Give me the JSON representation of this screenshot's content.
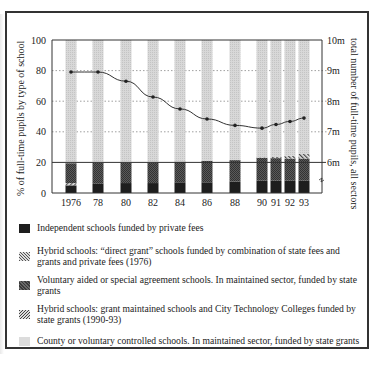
{
  "chart_data": {
    "type": "bar",
    "subtype": "stacked bar with line overlay (dual axis)",
    "title": "",
    "categories": [
      "1976",
      "78",
      "80",
      "82",
      "84",
      "86",
      "88",
      "90",
      "91",
      "92",
      "93"
    ],
    "ylabel": "% of full-time pupils by type of school",
    "ylim": [
      0,
      100
    ],
    "yticks": [
      "0",
      "20",
      "40",
      "60",
      "80",
      "100"
    ],
    "y2label": "total number of full-time pupils, all sectors",
    "y2lim": [
      "6m",
      "10m"
    ],
    "y2ticks": [
      "6m",
      "7m",
      "8m",
      "9m",
      "10m"
    ],
    "grid": "dotted horizontal at 40, 60, 80; solid line at 20",
    "legend_position": "below",
    "series": [
      {
        "name": "Independent schools funded by private fees",
        "key": "indep",
        "values": [
          5,
          6,
          6.5,
          6.5,
          7,
          7,
          7.5,
          8,
          8,
          8,
          8
        ]
      },
      {
        "name": "Hybrid schools: “direct grant” schools funded by combination of state fees and grants and private fees (1976)",
        "key": "direct",
        "values": [
          1.5,
          0,
          0,
          0,
          0,
          0,
          0,
          0,
          0,
          0,
          0
        ]
      },
      {
        "name": "Voluntary aided or special agreement schools. In maintained sector, funded by state grants",
        "key": "va",
        "values": [
          13,
          14,
          13.5,
          13.5,
          13.5,
          14,
          14,
          15,
          14.8,
          14.5,
          14.5
        ]
      },
      {
        "name": "Hybrid schools: grant maintained schools and City Technology Colleges funded by state grants (1990-93)",
        "key": "gm",
        "values": [
          0,
          0,
          0,
          0,
          0,
          0,
          0,
          0.3,
          0.8,
          1.8,
          3
        ]
      },
      {
        "name": "County or voluntary controlled schools. In maintained sector, funded by state grants",
        "key": "county",
        "values": [
          80.5,
          80,
          80,
          80,
          79.5,
          79,
          78.5,
          76.7,
          76.4,
          75.7,
          74.5
        ]
      }
    ],
    "line_series": {
      "name": "total number of full-time pupils, all sectors (millions)",
      "axis": "right",
      "values": [
        8.95,
        8.95,
        8.65,
        8.13,
        7.74,
        7.41,
        7.2,
        7.11,
        7.23,
        7.33,
        7.44
      ]
    }
  },
  "axes": {
    "left_ticks": [
      "100",
      "80",
      "60",
      "40",
      "20",
      "0"
    ],
    "right_ticks": [
      "10m",
      "9m",
      "8m",
      "7m",
      "6m"
    ],
    "left_title": "% of full-time pupils by type of school",
    "right_title": "total number of full-time pupils, all sectors",
    "x_labels": [
      "1976",
      "78",
      "80",
      "82",
      "84",
      "86",
      "88",
      "90",
      "91",
      "92",
      "93"
    ]
  },
  "legend": [
    {
      "swatch": "indep",
      "label": "Independent schools funded by private fees"
    },
    {
      "swatch": "direct",
      "label": "Hybrid schools: “direct grant” schools funded by combination of state fees and grants and private fees (1976)"
    },
    {
      "swatch": "va",
      "label": "Voluntary aided or special agreement schools. In maintained sector, funded by state grants"
    },
    {
      "swatch": "gm",
      "label": "Hybrid schools: grant maintained schools and City Technology Colleges funded by state grants (1990-93)"
    },
    {
      "swatch": "county",
      "label": "County or voluntary controlled schools. In maintained sector, funded by state grants"
    }
  ]
}
